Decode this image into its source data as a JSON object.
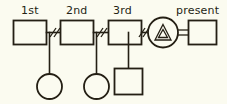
{
  "diagram": {
    "type": "genogram",
    "background_color": "#fbfbf0",
    "ink_color": "#241f14",
    "labels": {
      "first": "1st",
      "second": "2nd",
      "third": "3rd",
      "present": "present"
    },
    "unions": [
      {
        "id": "union-1",
        "label": "1st",
        "partner_shape": "square",
        "relationship_line": "divorced",
        "relationship_marker": "double-slash",
        "children": [
          {
            "shape": "circle",
            "name": "daughter"
          }
        ]
      },
      {
        "id": "union-2",
        "label": "2nd",
        "partner_shape": "square",
        "relationship_line": "divorced",
        "relationship_marker": "double-slash",
        "children": [
          {
            "shape": "circle",
            "name": "daughter"
          }
        ]
      },
      {
        "id": "union-3",
        "label": "3rd",
        "partner_shape": "square",
        "relationship_line": "divorced",
        "relationship_marker": "double-slash",
        "children": [
          {
            "shape": "square",
            "name": "son"
          }
        ]
      },
      {
        "id": "union-present",
        "label": "present",
        "partner_shape": "square",
        "relationship_line": "current",
        "relationship_marker": "double-bar",
        "children": []
      }
    ],
    "index_person": {
      "shape": "circle",
      "inner_symbol": "nested-triangle",
      "name": "index-person"
    }
  }
}
